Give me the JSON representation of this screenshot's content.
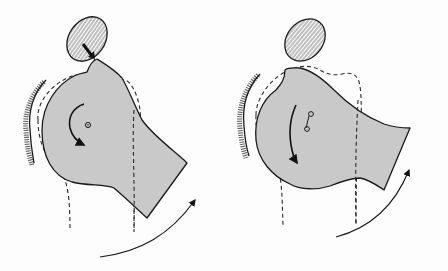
{
  "figure": {
    "panels": [
      {
        "id": "left",
        "elements": [
          "hatched-oval",
          "compression-arrows",
          "shaded-bone",
          "dashed-outline",
          "rotation-arrow",
          "center-point",
          "hatched-socket",
          "outer-rotation-arc"
        ]
      },
      {
        "id": "right",
        "elements": [
          "hatched-oval",
          "shaded-bone",
          "dashed-outline",
          "rotation-arrow",
          "two-center-points",
          "hatched-socket",
          "outer-rotation-arc"
        ]
      }
    ],
    "colors": {
      "bone_fill": "#c9c9c9",
      "stroke": "#1a1a1a",
      "background": "#fdfdfd"
    }
  }
}
